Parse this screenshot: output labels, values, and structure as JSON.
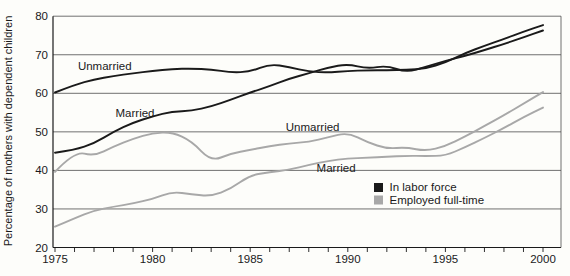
{
  "figure": {
    "background": "#fdfdfa",
    "axis_color": "#1a1a1a",
    "grid_color": "#4d4d4d"
  },
  "chart_data": {
    "type": "line",
    "title": "",
    "xlabel": "",
    "ylabel": "Percentage of mothers with dependent children",
    "ylim": [
      20,
      80
    ],
    "xlim": [
      1975,
      2000.9
    ],
    "grid": "horizontal",
    "yticks": [
      "20",
      "30",
      "40",
      "50",
      "60",
      "70",
      "80"
    ],
    "ytick_values": [
      20,
      30,
      40,
      50,
      60,
      70,
      80
    ],
    "x": [
      1975,
      1976,
      1977,
      1978,
      1979,
      1980,
      1981,
      1982,
      1983,
      1984,
      1985,
      1986,
      1987,
      1988,
      1989,
      1990,
      1991,
      1992,
      1993,
      1994,
      1995,
      1996,
      1997,
      1998,
      1999,
      2000
    ],
    "xtick_labels": [
      "1975",
      "1980",
      "1985",
      "1990",
      "1995",
      "2000"
    ],
    "xtick_label_years": [
      1975,
      1980,
      1985,
      1990,
      1995,
      2000
    ],
    "series": [
      {
        "name": "Unmarried — in labor force",
        "legend_group": "In labor force",
        "color": "#1a1a1a",
        "values": [
          60.2,
          62.2,
          63.6,
          64.5,
          65.2,
          65.8,
          66.3,
          66.4,
          66.2,
          65.4,
          65.6,
          67.6,
          66.8,
          65.6,
          65.4,
          65.8,
          66.0,
          66.0,
          66.1,
          66.4,
          68.0,
          70.4,
          72.3,
          74.1,
          76.0,
          77.7
        ]
      },
      {
        "name": "Married — in labor force",
        "legend_group": "In labor force",
        "color": "#1a1a1a",
        "values": [
          44.6,
          45.3,
          47.0,
          50.0,
          52.4,
          54.0,
          55.3,
          55.4,
          56.6,
          58.3,
          60.2,
          61.9,
          63.8,
          65.2,
          66.7,
          67.6,
          66.4,
          67.2,
          65.4,
          66.9,
          68.4,
          69.7,
          71.2,
          72.8,
          74.5,
          76.3
        ]
      },
      {
        "name": "Unmarried — employed full-time",
        "legend_group": "Employed full-time",
        "color": "#a8a8a8",
        "values": [
          39.6,
          45.0,
          43.7,
          46.2,
          48.2,
          49.7,
          49.9,
          47.6,
          42.3,
          44.4,
          45.3,
          46.3,
          47.0,
          47.4,
          48.6,
          49.8,
          47.3,
          45.6,
          46.0,
          45.0,
          46.3,
          48.8,
          51.5,
          54.3,
          57.3,
          60.3
        ]
      },
      {
        "name": "Married — employed full-time",
        "legend_group": "Employed full-time",
        "color": "#a8a8a8",
        "values": [
          25.4,
          27.6,
          29.6,
          30.6,
          31.4,
          32.6,
          34.5,
          33.8,
          33.3,
          35.2,
          38.8,
          39.5,
          40.2,
          41.4,
          42.5,
          43.1,
          43.3,
          43.5,
          43.8,
          43.7,
          43.8,
          46.0,
          48.4,
          51.0,
          53.8,
          56.3
        ]
      }
    ],
    "annotations": [
      {
        "text": "Unmarried",
        "x": 1977.55,
        "y": 67.1,
        "series": "in-labor-force"
      },
      {
        "text": "Married",
        "x": 1979.1,
        "y": 54.9,
        "series": "in-labor-force"
      },
      {
        "text": "Unmarried",
        "x": 1988.2,
        "y": 51.3,
        "series": "employed-full-time"
      },
      {
        "text": "Married",
        "x": 1989.4,
        "y": 40.7,
        "series": "employed-full-time"
      }
    ],
    "legend": {
      "position": "inside-bottom-center-right",
      "entries": [
        {
          "label": "In labor force",
          "color": "#1a1a1a"
        },
        {
          "label": "Employed full-time",
          "color": "#a8a8a8"
        }
      ]
    }
  }
}
